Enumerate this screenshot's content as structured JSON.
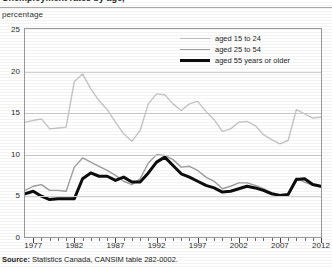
{
  "header": {
    "title_fragment": "Unemployment rates by age,",
    "title_note": "(clipped at top edge)",
    "axis_unit_label": "percentage"
  },
  "legend": {
    "position": "top-right-inside",
    "entries": [
      {
        "label": "aged 15 to 24",
        "color": "#c6c6c6",
        "style": "thin-light"
      },
      {
        "label": "aged 25 to 54",
        "color": "#9e9e9e",
        "style": "thin-medium"
      },
      {
        "label": "aged 55 years or older",
        "color": "#0d0d0d",
        "style": "thick-black"
      }
    ]
  },
  "source": {
    "prefix": "Source:",
    "text": " Statistics Canada, CANSIM table 282-0002."
  },
  "chart_data": {
    "type": "line",
    "title": "Unemployment rates by age,",
    "xlabel": "",
    "ylabel": "percentage",
    "ylim": [
      0,
      25
    ],
    "xlim": [
      1976,
      2012
    ],
    "yticks": [
      0,
      5,
      10,
      15,
      20,
      25
    ],
    "xticks": [
      1977,
      1982,
      1987,
      1992,
      1997,
      2002,
      2007,
      2012
    ],
    "grid": true,
    "legend_position": "upper right",
    "x": [
      1976,
      1977,
      1978,
      1979,
      1980,
      1981,
      1982,
      1983,
      1984,
      1985,
      1986,
      1987,
      1988,
      1989,
      1990,
      1991,
      1992,
      1993,
      1994,
      1995,
      1996,
      1997,
      1998,
      1999,
      2000,
      2001,
      2002,
      2003,
      2004,
      2005,
      2006,
      2007,
      2008,
      2009,
      2010,
      2011,
      2012
    ],
    "series": [
      {
        "name": "aged 15 to 24",
        "color": "#c6c6c6",
        "width": 1.4,
        "values": [
          13.8,
          14.0,
          14.2,
          13.0,
          13.1,
          13.2,
          18.7,
          19.6,
          17.8,
          16.4,
          15.3,
          13.8,
          12.4,
          11.5,
          12.8,
          16.0,
          17.2,
          17.1,
          16.0,
          15.2,
          16.0,
          16.3,
          15.1,
          14.1,
          12.7,
          13.0,
          13.8,
          13.9,
          13.4,
          12.3,
          11.7,
          11.2,
          11.6,
          15.3,
          14.8,
          14.3,
          14.4
        ]
      },
      {
        "name": "aged 25 to 54",
        "color": "#9e9e9e",
        "width": 1.4,
        "values": [
          5.6,
          6.1,
          6.3,
          5.6,
          5.6,
          5.5,
          8.4,
          9.5,
          9.0,
          8.5,
          8.0,
          7.4,
          6.7,
          6.3,
          7.0,
          8.9,
          9.9,
          9.8,
          9.3,
          8.4,
          8.5,
          8.0,
          7.2,
          6.7,
          5.8,
          6.1,
          6.5,
          6.5,
          6.2,
          5.8,
          5.3,
          5.1,
          5.1,
          7.1,
          6.6,
          6.2,
          6.0
        ]
      },
      {
        "name": "aged 55 years or older",
        "color": "#0d0d0d",
        "width": 3.0,
        "values": [
          5.2,
          5.5,
          4.9,
          4.5,
          4.6,
          4.6,
          4.6,
          7.0,
          7.7,
          7.3,
          7.3,
          6.8,
          7.2,
          6.6,
          6.6,
          7.7,
          9.0,
          9.6,
          8.6,
          7.6,
          7.2,
          6.7,
          6.2,
          5.9,
          5.4,
          5.5,
          5.8,
          6.1,
          5.9,
          5.6,
          5.2,
          5.0,
          5.1,
          6.9,
          7.0,
          6.3,
          6.1
        ]
      }
    ]
  }
}
